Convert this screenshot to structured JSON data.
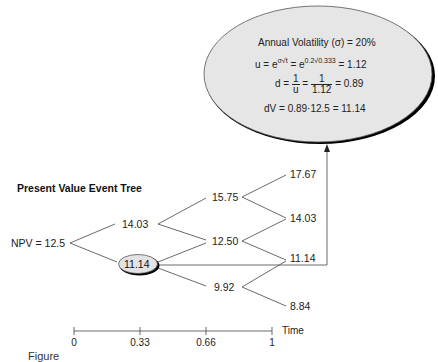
{
  "diagram": {
    "title": "Present Value Event Tree",
    "root": {
      "label": "NPV = 12.5"
    },
    "level1": [
      {
        "label": "14.03",
        "branch": "up"
      },
      {
        "label": "11.14",
        "branch": "down",
        "highlighted": true
      }
    ],
    "level2": [
      {
        "label": "15.75"
      },
      {
        "label": "12.50"
      },
      {
        "label": "9.92"
      }
    ],
    "level3": [
      {
        "label": "17.67"
      },
      {
        "label": "14.03"
      },
      {
        "label": "11.14"
      },
      {
        "label": "8.84"
      }
    ],
    "callout": {
      "line1": "Annual Volatility (σ) = 20%",
      "line2": {
        "u": "u = e",
        "u_exp": "σ√t",
        "eq": " = e",
        "e_exp": "0.2√0.333",
        "result": " = 1.12"
      },
      "line3": {
        "d": "d = ",
        "frac1_num": "1",
        "frac1_den": "u",
        "eq": " = ",
        "frac2_num": "1",
        "frac2_den": "1.12",
        "result": " = 0.89"
      },
      "line4": "dV = 0.89·12.5 = 11.14"
    },
    "timeline": {
      "ticks": [
        "0",
        "0.33",
        "0.66",
        "1"
      ],
      "axis_label": "Time"
    },
    "caption": "Figure",
    "colors": {
      "ellipse_fill": "#e6e6e6",
      "stroke": "#333333",
      "shadow": "#000000"
    }
  }
}
